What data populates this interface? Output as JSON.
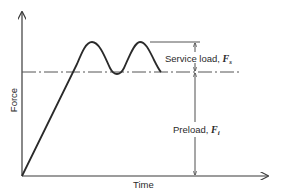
{
  "diagram": {
    "type": "force-time plot",
    "axes": {
      "y_label": "Force",
      "x_label": "Time"
    },
    "annotations": {
      "service_load": {
        "text": "Service load, ",
        "symbol": "F",
        "subscript": "s"
      },
      "preload": {
        "text": "Preload, ",
        "symbol": "F",
        "subscript": "i"
      }
    },
    "colors": {
      "line": "#2a2a2a",
      "axis": "#3a3a3a",
      "dashed": "#555555"
    }
  }
}
